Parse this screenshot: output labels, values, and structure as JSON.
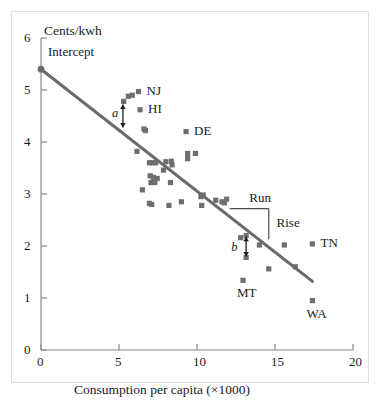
{
  "chart_data": {
    "type": "scatter",
    "title": "",
    "xlabel": "Consumption per capita (×1000)",
    "ylabel": "Cents/kwh",
    "xlim": [
      0,
      20
    ],
    "ylim": [
      0,
      6
    ],
    "xticks": [
      0,
      5,
      10,
      15,
      20
    ],
    "yticks": [
      0,
      1,
      2,
      3,
      4,
      5,
      6
    ],
    "xtick_labels": [
      "0",
      "5",
      "10",
      "15",
      "20"
    ],
    "ytick_labels": [
      "0",
      "1",
      "2",
      "3",
      "4",
      "5",
      "6"
    ],
    "grid": false,
    "legend": false,
    "marker": "square",
    "marker_color": "#6e6e6e",
    "line_color": "#6b6b6b",
    "points": [
      {
        "x": 5.3,
        "y": 4.78
      },
      {
        "x": 5.6,
        "y": 4.88
      },
      {
        "x": 5.85,
        "y": 4.9
      },
      {
        "x": 6.25,
        "y": 4.97,
        "label": "NJ"
      },
      {
        "x": 6.35,
        "y": 4.62,
        "label": "HI"
      },
      {
        "x": 6.6,
        "y": 4.25
      },
      {
        "x": 6.7,
        "y": 4.22
      },
      {
        "x": 6.15,
        "y": 3.82
      },
      {
        "x": 9.3,
        "y": 4.2,
        "label": "DE"
      },
      {
        "x": 9.4,
        "y": 3.78
      },
      {
        "x": 9.9,
        "y": 3.78
      },
      {
        "x": 9.4,
        "y": 3.68
      },
      {
        "x": 8.0,
        "y": 3.62
      },
      {
        "x": 8.35,
        "y": 3.63
      },
      {
        "x": 6.95,
        "y": 3.6
      },
      {
        "x": 7.15,
        "y": 3.6
      },
      {
        "x": 7.35,
        "y": 3.6
      },
      {
        "x": 8.4,
        "y": 3.56
      },
      {
        "x": 7.85,
        "y": 3.46
      },
      {
        "x": 7.0,
        "y": 3.35
      },
      {
        "x": 7.2,
        "y": 3.32
      },
      {
        "x": 7.45,
        "y": 3.3
      },
      {
        "x": 7.05,
        "y": 3.22
      },
      {
        "x": 7.3,
        "y": 3.22
      },
      {
        "x": 8.3,
        "y": 3.22
      },
      {
        "x": 6.5,
        "y": 3.08
      },
      {
        "x": 10.4,
        "y": 2.98
      },
      {
        "x": 10.25,
        "y": 2.95
      },
      {
        "x": 11.9,
        "y": 2.9
      },
      {
        "x": 11.2,
        "y": 2.88
      },
      {
        "x": 11.6,
        "y": 2.85
      },
      {
        "x": 11.75,
        "y": 2.83
      },
      {
        "x": 9.0,
        "y": 2.85
      },
      {
        "x": 6.95,
        "y": 2.82
      },
      {
        "x": 7.1,
        "y": 2.8
      },
      {
        "x": 8.2,
        "y": 2.78
      },
      {
        "x": 10.3,
        "y": 2.78
      },
      {
        "x": 12.8,
        "y": 2.16
      },
      {
        "x": 13.15,
        "y": 2.2
      },
      {
        "x": 14.0,
        "y": 2.02
      },
      {
        "x": 15.6,
        "y": 2.02
      },
      {
        "x": 17.4,
        "y": 2.04,
        "label": "TN"
      },
      {
        "x": 13.15,
        "y": 1.78
      },
      {
        "x": 14.6,
        "y": 1.56
      },
      {
        "x": 16.3,
        "y": 1.6
      },
      {
        "x": 12.95,
        "y": 1.34,
        "label": "MT"
      },
      {
        "x": 17.4,
        "y": 0.95,
        "label": "WA"
      }
    ],
    "regression_line": {
      "intercept": 5.4,
      "slope": -0.2343,
      "x_start": 0.0,
      "y_start": 5.4,
      "x_end": 17.4,
      "y_end": 1.32
    },
    "intercept_marker": {
      "x": 0.0,
      "y": 5.4,
      "shape": "circle"
    },
    "annotations": [
      {
        "name": "intercept",
        "text": "Intercept",
        "x": 0.45,
        "y": 5.72
      },
      {
        "name": "residual-a",
        "text": "a",
        "italic": true,
        "x": 4.55,
        "y": 4.52
      },
      {
        "name": "residual-b",
        "text": "b",
        "italic": true,
        "x": 12.2,
        "y": 1.95
      },
      {
        "name": "run",
        "text": "Run",
        "x": 13.35,
        "y": 2.9
      },
      {
        "name": "rise",
        "text": "Rise",
        "x": 15.1,
        "y": 2.43
      }
    ],
    "slope_triangle": {
      "x_left": 12.1,
      "x_right": 14.6,
      "y_top": 2.72,
      "y_bottom": 2.13
    },
    "residual_arrows": [
      {
        "name": "a",
        "x": 5.25,
        "y_top": 4.72,
        "y_bottom": 4.28
      },
      {
        "name": "b",
        "x": 13.15,
        "y_top": 2.18,
        "y_bottom": 1.8
      }
    ]
  },
  "axes": {
    "y_axis_title": "Cents/kwh",
    "x_axis_title": "Consumption per capita (×1000)"
  }
}
